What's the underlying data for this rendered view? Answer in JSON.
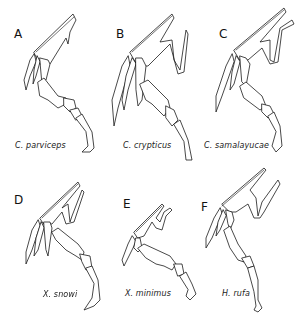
{
  "figure": {
    "panels": [
      {
        "letter": "A",
        "species": "C. parviceps"
      },
      {
        "letter": "B",
        "species": "C. crypticus"
      },
      {
        "letter": "C",
        "species": "C. samalayucae"
      },
      {
        "letter": "D",
        "species": "X. snowi"
      },
      {
        "letter": "E",
        "species": "X. minimus"
      },
      {
        "letter": "F",
        "species": "H. rufa"
      }
    ]
  }
}
